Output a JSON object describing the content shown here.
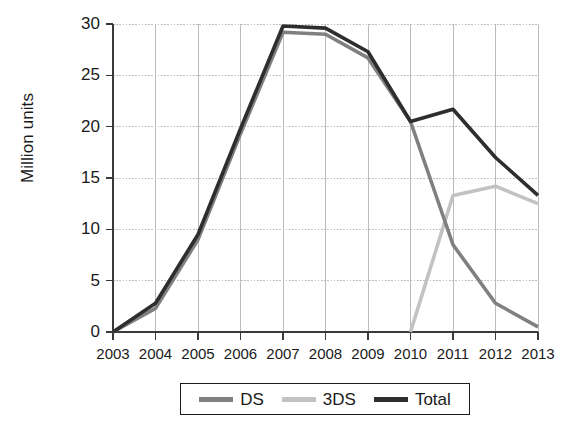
{
  "chart_data": {
    "type": "line",
    "title": "",
    "subtitle": "",
    "xlabel": "",
    "ylabel": "Million units",
    "x": [
      2003,
      2004,
      2005,
      2006,
      2007,
      2008,
      2009,
      2010,
      2011,
      2012,
      2013
    ],
    "categories": [
      "2003",
      "2004",
      "2005",
      "2006",
      "2007",
      "2008",
      "2009",
      "2010",
      "2011",
      "2012",
      "2013"
    ],
    "xlim": [
      2003,
      2013
    ],
    "ylim": [
      0,
      30
    ],
    "yticks": [
      0,
      5,
      10,
      15,
      20,
      25,
      30
    ],
    "ytick_labels": [
      "0",
      "5",
      "10",
      "15",
      "20",
      "25",
      "30"
    ],
    "grid": true,
    "legend_position": "below-axis-center",
    "series": [
      {
        "name": "DS",
        "color": "#808080",
        "values": [
          0,
          2.3,
          9.0,
          19.3,
          29.2,
          29.0,
          26.7,
          20.5,
          8.5,
          2.8,
          0.5
        ]
      },
      {
        "name": "3DS",
        "color": "#c2c2c2",
        "values": [
          null,
          null,
          null,
          null,
          null,
          null,
          null,
          0,
          13.3,
          14.2,
          12.5
        ]
      },
      {
        "name": "Total",
        "color": "#2e2e2e",
        "values": [
          0,
          2.8,
          9.5,
          19.8,
          29.8,
          29.6,
          27.3,
          20.5,
          21.7,
          17.0,
          13.3
        ]
      }
    ]
  },
  "legend": {
    "items": [
      {
        "label": "DS",
        "color": "#808080"
      },
      {
        "label": "3DS",
        "color": "#c2c2c2"
      },
      {
        "label": "Total",
        "color": "#2e2e2e"
      }
    ]
  },
  "axes": {
    "y_axis_title": "Million units",
    "axis_color": "#3a3a3a",
    "grid_color": "#b5b5b5"
  }
}
